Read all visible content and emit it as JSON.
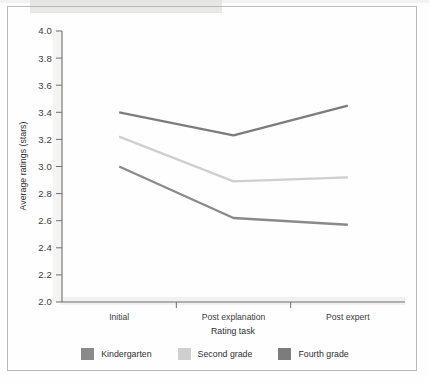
{
  "figure": {
    "background_color": "#fefefe",
    "frame_color": "#b9b9b7"
  },
  "chart_data": {
    "type": "line",
    "title": "",
    "xlabel": "Rating task",
    "ylabel": "Average ratings (stars)",
    "categories": [
      "Initial",
      "Post explanation",
      "Post expert"
    ],
    "ylim": [
      2.0,
      4.0
    ],
    "ytick_step": 0.2,
    "ytick_labels": [
      "2.0",
      "2.2",
      "2.4",
      "2.6",
      "2.8",
      "3.0",
      "3.2",
      "3.4",
      "3.6",
      "3.8",
      "4.0"
    ],
    "grid": false,
    "legend_position": "bottom",
    "series": [
      {
        "name": "Kindergarten",
        "color": "#8a8a8a",
        "values": [
          3.0,
          2.62,
          2.57
        ]
      },
      {
        "name": "Second grade",
        "color": "#cfcfcf",
        "values": [
          3.22,
          2.89,
          2.92
        ]
      },
      {
        "name": "Fourth grade",
        "color": "#7c7c7c",
        "values": [
          3.4,
          3.23,
          3.45
        ]
      }
    ]
  },
  "legend": {
    "items": [
      {
        "label": "Kindergarten",
        "color": "#8a8a8a"
      },
      {
        "label": "Second grade",
        "color": "#cfcfcf"
      },
      {
        "label": "Fourth grade",
        "color": "#7c7c7c"
      }
    ]
  }
}
